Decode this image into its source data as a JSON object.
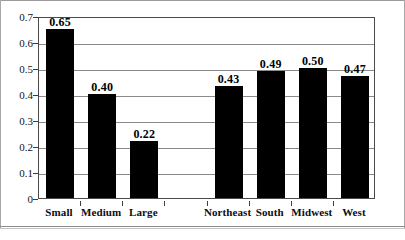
{
  "chart_data": {
    "type": "bar",
    "title": "",
    "subtitle": "",
    "xlabel": "",
    "ylabel": "",
    "categories": [
      "Small",
      "Medium",
      "Large",
      "",
      "Northeast",
      "South",
      "Midwest",
      "West"
    ],
    "values": [
      0.65,
      0.4,
      0.22,
      null,
      0.43,
      0.49,
      0.5,
      0.47
    ],
    "value_labels": [
      "0.65",
      "0.40",
      "0.22",
      "",
      "0.43",
      "0.49",
      "0.50",
      "0.47"
    ],
    "ylim": [
      0,
      0.7
    ],
    "ytick_values": [
      0,
      0.1,
      0.2,
      0.3,
      0.4,
      0.5,
      0.6,
      0.7
    ],
    "ytick_labels": [
      "0",
      "0.1",
      "0.2",
      "0.3",
      "0.4",
      "0.5",
      "0.6",
      "0.7"
    ],
    "grid": true,
    "grid_axis": "y",
    "legend": null,
    "legend_position": "none",
    "bar_color": "#000000",
    "grid_color": "#8a8a8a",
    "frame_color": "#4a4a4a",
    "groups": [
      {
        "name": "size",
        "categories": [
          "Small",
          "Medium",
          "Large"
        ],
        "values": [
          0.65,
          0.4,
          0.22
        ]
      },
      {
        "name": "region",
        "categories": [
          "Northeast",
          "South",
          "Midwest",
          "West"
        ],
        "values": [
          0.43,
          0.49,
          0.5,
          0.47
        ]
      }
    ]
  }
}
